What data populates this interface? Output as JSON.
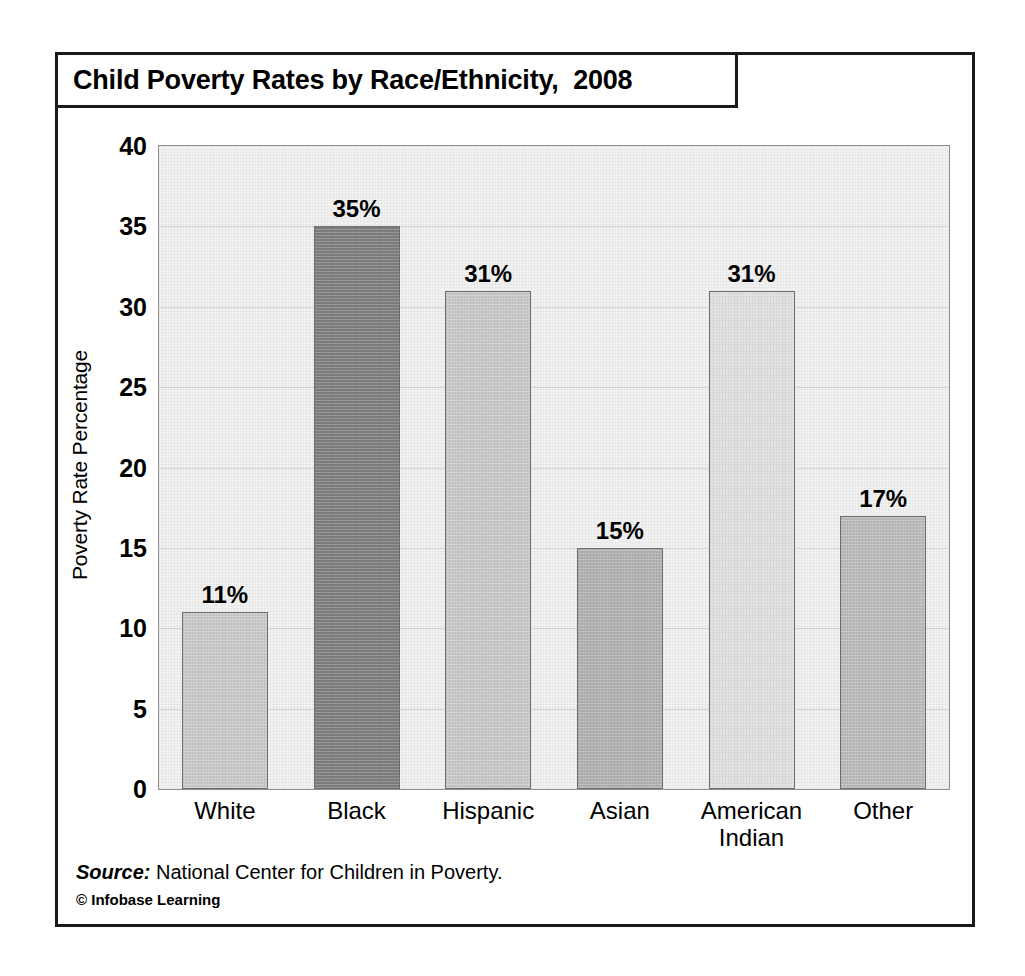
{
  "title": "Child Poverty Rates by Race/Ethnicity,  2008",
  "footer": {
    "source_label": "Source:",
    "source_text": " National Center for Children in Poverty.",
    "copyright": "© Infobase Learning"
  },
  "chart_data": {
    "type": "bar",
    "title": "Child Poverty Rates by Race/Ethnicity,  2008",
    "xlabel": "",
    "ylabel": "Poverty Rate Percentage",
    "ylim": [
      0,
      40
    ],
    "yticks": [
      0,
      5,
      10,
      15,
      20,
      25,
      30,
      35,
      40
    ],
    "ytick_labels": [
      "0",
      "5",
      "10",
      "15",
      "20",
      "25",
      "30",
      "35",
      "40"
    ],
    "grid": true,
    "legend": "none",
    "categories": [
      "White",
      "Black",
      "Hispanic",
      "Asian",
      "American Indian",
      "Other"
    ],
    "category_lines": [
      [
        "White"
      ],
      [
        "Black"
      ],
      [
        "Hispanic"
      ],
      [
        "Asian"
      ],
      [
        "American",
        "Indian"
      ],
      [
        "Other"
      ]
    ],
    "values": [
      11,
      35,
      31,
      15,
      31,
      17
    ],
    "value_labels": [
      "11%",
      "35%",
      "31%",
      "15%",
      "31%",
      "17%"
    ],
    "bar_colors": [
      "#c8c8c8",
      "#7d7d7d",
      "#c6c6c6",
      "#b0b0b0",
      "#dedede",
      "#b9b9b9"
    ],
    "bar_edge_color": "#6e6e6e",
    "plot_background": "#f2f2f2",
    "gridline_color": "#d4d4d4",
    "frame_color": "#1a1a1a",
    "units": "percent"
  }
}
